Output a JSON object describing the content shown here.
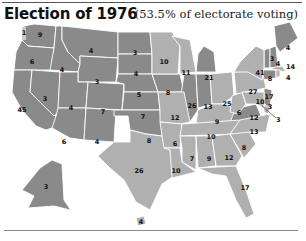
{
  "header": {
    "title": "Election of 1976",
    "subtitle": "(53.5% of electorate voting)"
  },
  "colors": {
    "ford": "#8a8a8a",
    "carter": "#b0b0b0",
    "faithless": "#c8c8c8",
    "border": "#ffffff"
  },
  "states": {
    "WA": {
      "votes": "9",
      "faithless": "1"
    },
    "OR": {
      "votes": "6"
    },
    "CA": {
      "votes": "45"
    },
    "ID": {
      "votes": "4"
    },
    "NV": {
      "votes": "3"
    },
    "MT": {
      "votes": "4"
    },
    "WY": {
      "votes": "3"
    },
    "UT": {
      "votes": "4"
    },
    "AZ": {
      "votes": "6"
    },
    "CO": {
      "votes": "7"
    },
    "NM": {
      "votes": "4"
    },
    "ND": {
      "votes": "3"
    },
    "SD": {
      "votes": "4"
    },
    "NE": {
      "votes": "5"
    },
    "KS": {
      "votes": "7"
    },
    "OK": {
      "votes": "8"
    },
    "TX": {
      "votes": "26"
    },
    "MN": {
      "votes": "10"
    },
    "IA": {
      "votes": "8"
    },
    "MO": {
      "votes": "12"
    },
    "AR": {
      "votes": "6"
    },
    "LA": {
      "votes": "10"
    },
    "WI": {
      "votes": "11"
    },
    "IL": {
      "votes": "26"
    },
    "MI": {
      "votes": "21"
    },
    "IN": {
      "votes": "13"
    },
    "OH": {
      "votes": "25"
    },
    "KY": {
      "votes": "9"
    },
    "TN": {
      "votes": "10"
    },
    "MS": {
      "votes": "7"
    },
    "AL": {
      "votes": "9"
    },
    "GA": {
      "votes": "12"
    },
    "FL": {
      "votes": "17"
    },
    "SC": {
      "votes": "8"
    },
    "NC": {
      "votes": "13"
    },
    "VA": {
      "votes": "12"
    },
    "WV": {
      "votes": "6"
    },
    "PA": {
      "votes": "27"
    },
    "NY": {
      "votes": "41"
    },
    "VT": {
      "votes": "3"
    },
    "NH": {
      "votes": "4"
    },
    "ME": {
      "votes": "4"
    },
    "MA": {
      "votes": "14"
    },
    "RI": {
      "votes": "4"
    },
    "CT": {
      "votes": "8"
    },
    "NJ": {
      "votes": "17"
    },
    "DE": {
      "votes": "3"
    },
    "MD": {
      "votes": "10"
    },
    "DC": {
      "votes": "3"
    },
    "AK": {
      "votes": "3"
    },
    "HI": {
      "votes": "4"
    }
  }
}
